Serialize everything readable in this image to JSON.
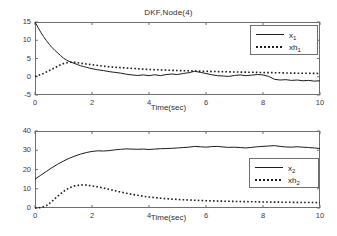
{
  "figure": {
    "background_color": "#ffffff",
    "line_color": "#1c1c1c",
    "axis_color": "#6f6f6f"
  },
  "chart_data": [
    {
      "type": "line",
      "title": "DKF,Node(4)",
      "xlabel": "Time(sec)",
      "ylabel": "",
      "xlim": [
        0,
        10
      ],
      "ylim": [
        -5,
        15
      ],
      "xticks": [
        0,
        2,
        4,
        6,
        8,
        10
      ],
      "yticks": [
        -5,
        0,
        5,
        10,
        15
      ],
      "grid": false,
      "legend_position": "upper right",
      "series": [
        {
          "name": "x_1",
          "label": "x",
          "sub": "1",
          "style": "solid",
          "x": [
            0,
            0.1,
            0.2,
            0.3,
            0.4,
            0.5,
            0.6,
            0.7,
            0.8,
            0.9,
            1.0,
            1.1,
            1.2,
            1.3,
            1.4,
            1.5,
            1.6,
            1.7,
            1.8,
            1.9,
            2.0,
            2.2,
            2.4,
            2.6,
            2.8,
            3.0,
            3.2,
            3.4,
            3.6,
            3.8,
            4.0,
            4.2,
            4.4,
            4.6,
            4.8,
            5.0,
            5.2,
            5.4,
            5.6,
            5.8,
            6.0,
            6.2,
            6.4,
            6.6,
            6.8,
            7.0,
            7.2,
            7.4,
            7.6,
            7.8,
            8.0,
            8.2,
            8.4,
            8.6,
            8.8,
            9.0,
            9.2,
            9.4,
            9.6,
            9.8,
            10.0
          ],
          "y": [
            15.0,
            13.6,
            12.2,
            11.0,
            9.9,
            8.9,
            8.0,
            7.2,
            6.5,
            5.8,
            5.1,
            4.6,
            4.2,
            3.9,
            3.6,
            3.3,
            3.0,
            2.8,
            2.6,
            2.4,
            2.2,
            1.9,
            1.7,
            1.4,
            1.2,
            1.0,
            0.7,
            0.5,
            0.35,
            0.5,
            0.3,
            0.55,
            0.3,
            0.6,
            0.75,
            0.6,
            0.9,
            1.1,
            1.5,
            1.2,
            0.9,
            0.55,
            0.3,
            0.2,
            0.1,
            0.35,
            0.5,
            0.3,
            0.45,
            0.6,
            0.5,
            0.1,
            -0.7,
            -0.9,
            -0.8,
            -1.0,
            -0.9,
            -1.1,
            -1.0,
            -1.2,
            -1.1
          ]
        },
        {
          "name": "xh_1",
          "label": "xh",
          "sub": "1",
          "style": "dotted",
          "x": [
            0,
            0.1,
            0.2,
            0.3,
            0.4,
            0.5,
            0.6,
            0.7,
            0.8,
            0.9,
            1.0,
            1.1,
            1.2,
            1.3,
            1.4,
            1.5,
            1.6,
            1.7,
            1.8,
            1.9,
            2.0,
            2.2,
            2.4,
            2.6,
            2.8,
            3.0,
            3.2,
            3.4,
            3.6,
            3.8,
            4.0,
            4.5,
            5.0,
            5.5,
            6.0,
            6.5,
            7.0,
            7.5,
            8.0,
            8.5,
            9.0,
            9.5,
            10.0
          ],
          "y": [
            0.1,
            0.3,
            0.6,
            0.9,
            1.3,
            1.7,
            2.1,
            2.5,
            2.9,
            3.3,
            3.6,
            3.8,
            3.95,
            4.0,
            3.95,
            3.85,
            3.7,
            3.6,
            3.5,
            3.4,
            3.3,
            3.1,
            2.9,
            2.75,
            2.6,
            2.5,
            2.4,
            2.3,
            2.2,
            2.1,
            2.0,
            1.85,
            1.7,
            1.6,
            1.5,
            1.4,
            1.3,
            1.25,
            1.15,
            1.1,
            1.0,
            0.95,
            0.9
          ]
        }
      ]
    },
    {
      "type": "line",
      "title": "",
      "xlabel": "Time(sec)",
      "ylabel": "",
      "xlim": [
        0,
        10
      ],
      "ylim": [
        0,
        40
      ],
      "xticks": [
        0,
        2,
        4,
        6,
        8,
        10
      ],
      "yticks": [
        0,
        10,
        20,
        30,
        40
      ],
      "grid": false,
      "legend_position": "center right",
      "series": [
        {
          "name": "x_2",
          "label": "x",
          "sub": "2",
          "style": "solid",
          "x": [
            0,
            0.2,
            0.4,
            0.6,
            0.8,
            1.0,
            1.2,
            1.4,
            1.6,
            1.8,
            2.0,
            2.2,
            2.4,
            2.6,
            2.8,
            3.0,
            3.2,
            3.4,
            3.6,
            3.8,
            4.0,
            4.2,
            4.4,
            4.6,
            4.8,
            5.0,
            5.2,
            5.4,
            5.6,
            5.8,
            6.0,
            6.2,
            6.4,
            6.6,
            6.8,
            7.0,
            7.2,
            7.4,
            7.6,
            7.8,
            8.0,
            8.2,
            8.4,
            8.6,
            8.8,
            9.0,
            9.2,
            9.4,
            9.6,
            9.8,
            10.0
          ],
          "y": [
            15.0,
            17.0,
            19.0,
            21.0,
            22.8,
            24.4,
            25.8,
            27.0,
            28.0,
            28.8,
            29.4,
            29.7,
            29.6,
            29.8,
            30.2,
            30.5,
            30.7,
            30.6,
            30.5,
            30.6,
            30.4,
            30.6,
            30.8,
            30.9,
            31.0,
            31.2,
            31.4,
            31.6,
            32.0,
            31.8,
            31.6,
            31.9,
            32.0,
            31.7,
            31.5,
            31.6,
            31.4,
            31.2,
            31.5,
            31.8,
            32.0,
            32.2,
            32.4,
            32.0,
            31.7,
            31.6,
            31.8,
            31.6,
            31.4,
            31.2,
            30.9
          ]
        },
        {
          "name": "xh_2",
          "label": "xh",
          "sub": "2",
          "style": "dotted",
          "x": [
            0,
            0.2,
            0.4,
            0.6,
            0.8,
            1.0,
            1.2,
            1.4,
            1.6,
            1.8,
            2.0,
            2.2,
            2.4,
            2.6,
            2.8,
            3.0,
            3.2,
            3.4,
            3.6,
            3.8,
            4.0,
            4.4,
            4.8,
            5.2,
            5.6,
            6.0,
            6.4,
            6.8,
            7.2,
            7.6,
            8.0,
            8.4,
            8.8,
            9.2,
            9.6,
            10.0
          ],
          "y": [
            0.0,
            0.2,
            1.2,
            3.5,
            6.2,
            8.6,
            10.4,
            11.5,
            12.0,
            11.9,
            11.5,
            11.0,
            10.4,
            9.7,
            9.0,
            8.3,
            7.7,
            7.1,
            6.6,
            6.1,
            5.7,
            5.1,
            4.6,
            4.3,
            4.0,
            3.8,
            3.6,
            3.5,
            3.35,
            3.25,
            3.15,
            3.05,
            3.0,
            2.9,
            2.85,
            2.8
          ]
        }
      ]
    }
  ]
}
